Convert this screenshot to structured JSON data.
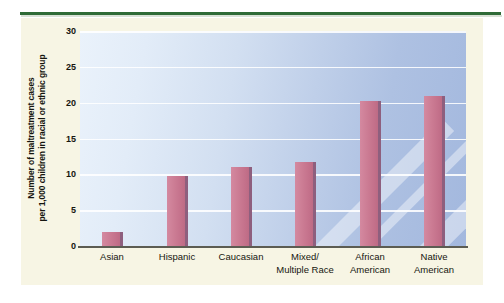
{
  "figure": {
    "background_color": "#f7f5e4",
    "rule_color": "#2f6b37",
    "bar_color": "#cb7b93",
    "bar_edge_color": "#8e5f7e",
    "gridline_color": "#ffffff"
  },
  "chart_data": {
    "type": "bar",
    "title": "",
    "xlabel": "",
    "ylabel": "Number of maltreatment cases per 1,000 children in racial or ethnic group",
    "ylabel_lines": [
      "Number of maltreatment cases",
      "per 1,000 children in racial or ethnic group"
    ],
    "categories": [
      "Asian",
      "Hispanic",
      "Caucasian",
      "Mixed/ Multiple Race",
      "African American",
      "Native American"
    ],
    "category_lines": [
      [
        "Asian"
      ],
      [
        "Hispanic"
      ],
      [
        "Caucasian"
      ],
      [
        "Mixed/",
        "Multiple Race"
      ],
      [
        "African",
        "American"
      ],
      [
        "Native",
        "American"
      ]
    ],
    "values": [
      2,
      9.7,
      11,
      11.7,
      20.3,
      21
    ],
    "ylim": [
      0,
      30
    ],
    "yticks": [
      0,
      5,
      10,
      15,
      20,
      25,
      30
    ],
    "ytick_labels": [
      "0",
      "5",
      "10",
      "15",
      "20",
      "25",
      "30"
    ],
    "grid": true,
    "legend": false,
    "legend_position": "none"
  }
}
